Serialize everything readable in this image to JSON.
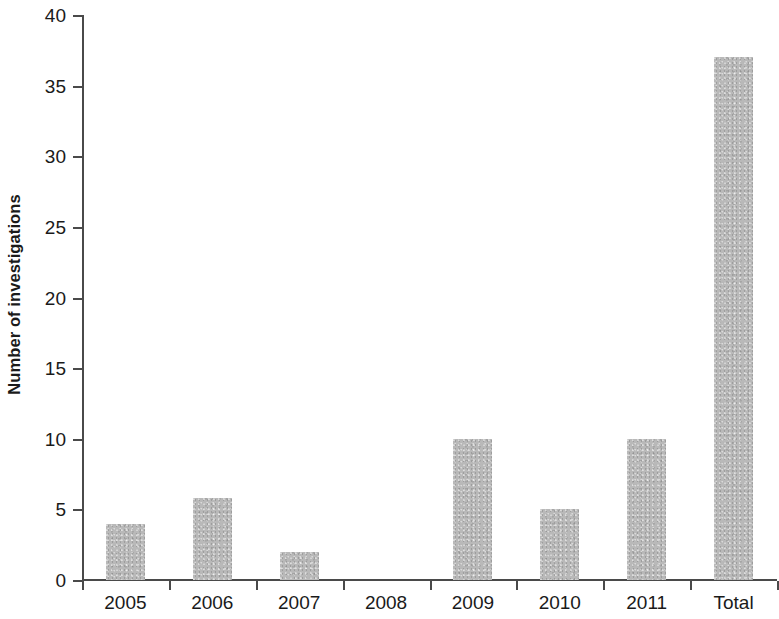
{
  "chart_data": {
    "type": "bar",
    "title": "",
    "subtitle": "",
    "xlabel": "",
    "ylabel": "Number of investigations",
    "categories": [
      "2005",
      "2006",
      "2007",
      "2008",
      "2009",
      "2010",
      "2011",
      "Total"
    ],
    "values": [
      4,
      5.8,
      2,
      0,
      10,
      5,
      10,
      37
    ],
    "series": [
      {
        "name": "Number of investigations",
        "values": [
          4,
          5.8,
          2,
          0,
          10,
          5,
          10,
          37
        ]
      }
    ],
    "ylim": [
      0,
      40
    ],
    "y_ticks": [
      0,
      5,
      10,
      15,
      20,
      25,
      30,
      35,
      40
    ],
    "y_tick_labels": [
      "0",
      "5",
      "10",
      "15",
      "20",
      "25",
      "30",
      "35",
      "40"
    ],
    "grid": false,
    "legend": false,
    "legend_position": "none",
    "bar_color": "#b9b9b9",
    "axis_color": "#4a4a4a",
    "text_color": "#1a1a1a",
    "background_color": "#ffffff"
  }
}
